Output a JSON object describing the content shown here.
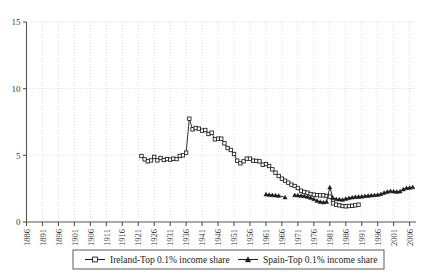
{
  "chart_data": {
    "type": "line",
    "title": "",
    "subtitle": "",
    "xlabel": "",
    "ylabel": "",
    "xlim": [
      1886,
      2008
    ],
    "ylim": [
      0,
      15
    ],
    "yticks": [
      0,
      5,
      10,
      15
    ],
    "xticks": [
      1886,
      1891,
      1896,
      1901,
      1906,
      1911,
      1916,
      1921,
      1926,
      1931,
      1936,
      1941,
      1946,
      1951,
      1956,
      1961,
      1966,
      1971,
      1976,
      1981,
      1986,
      1991,
      1996,
      2001,
      2006
    ],
    "grid": true,
    "grid_style": "dotted",
    "grid_color": "#c8c8c8",
    "legend_position": "bottom-outside",
    "axis_color": "#555555",
    "series": [
      {
        "name": "Ireland-Top 0.1% income share",
        "legend_label": "Ireland-Top 0.1% income share",
        "marker": "open-square",
        "color": "#1a1a1a",
        "x": [
          1922,
          1923,
          1924,
          1925,
          1926,
          1927,
          1928,
          1929,
          1930,
          1931,
          1932,
          1933,
          1934,
          1935,
          1936,
          1937,
          1938,
          1939,
          1940,
          1941,
          1942,
          1943,
          1944,
          1945,
          1946,
          1947,
          1948,
          1949,
          1950,
          1951,
          1952,
          1953,
          1954,
          1955,
          1956,
          1957,
          1958,
          1959,
          1960,
          1961,
          1962,
          1963,
          1964,
          1965,
          1966,
          1967,
          1968,
          1969,
          1970,
          1971,
          1972,
          1973,
          1974,
          1975,
          1976,
          1977,
          1978,
          1979,
          1980,
          1981,
          1982,
          1983,
          1984,
          1985,
          1986,
          1987,
          1988,
          1989,
          1990
        ],
        "y": [
          4.95,
          4.7,
          4.55,
          4.62,
          4.88,
          4.62,
          4.8,
          4.65,
          4.72,
          4.68,
          4.75,
          4.72,
          4.95,
          5.0,
          5.2,
          7.75,
          6.95,
          7.05,
          7.0,
          6.85,
          6.9,
          6.6,
          6.7,
          6.2,
          6.25,
          6.25,
          5.9,
          5.55,
          5.4,
          5.1,
          4.6,
          4.4,
          4.55,
          4.75,
          4.75,
          4.6,
          4.58,
          4.55,
          4.3,
          4.35,
          4.2,
          3.95,
          3.7,
          3.45,
          3.25,
          3.1,
          2.95,
          2.8,
          2.7,
          2.55,
          2.35,
          2.25,
          2.2,
          2.1,
          2.05,
          2.02,
          2.0,
          2.0,
          1.95,
          1.9,
          1.4,
          1.3,
          1.25,
          1.2,
          1.18,
          1.2,
          1.22,
          1.25,
          1.3
        ]
      },
      {
        "name": "Spain-Top 0.1% income share",
        "legend_label": "Spain-Top 0.1% income share",
        "marker": "filled-triangle",
        "color": "#1a1a1a",
        "x": [
          1961,
          1962,
          1963,
          1964,
          1965,
          1967,
          1970,
          1971,
          1972,
          1973,
          1974,
          1975,
          1976,
          1977,
          1978,
          1979,
          1980,
          1981,
          1982,
          1983,
          1984,
          1985,
          1986,
          1987,
          1988,
          1989,
          1990,
          1991,
          1992,
          1993,
          1994,
          1995,
          1996,
          1997,
          1998,
          1999,
          2000,
          2001,
          2002,
          2003,
          2004,
          2005,
          2006,
          2007
        ],
        "y": [
          2.08,
          2.05,
          2.02,
          2.0,
          1.98,
          1.85,
          2.02,
          2.0,
          1.98,
          1.95,
          1.9,
          1.82,
          1.72,
          1.6,
          1.52,
          1.48,
          1.52,
          2.6,
          1.8,
          1.72,
          1.7,
          1.68,
          1.75,
          1.8,
          1.85,
          1.88,
          1.9,
          1.92,
          1.95,
          1.98,
          2.0,
          2.02,
          2.05,
          2.1,
          2.2,
          2.28,
          2.32,
          2.3,
          2.28,
          2.3,
          2.45,
          2.55,
          2.58,
          2.62
        ]
      }
    ]
  },
  "legend": {
    "entries": [
      {
        "label": "Ireland-Top 0.1% income share",
        "marker": "open-square"
      },
      {
        "label": "Spain-Top 0.1% income share",
        "marker": "filled-triangle"
      }
    ]
  },
  "axes": {
    "y_labels": [
      "0",
      "5",
      "10",
      "15"
    ],
    "x_labels": [
      "1886",
      "1891",
      "1896",
      "1901",
      "1906",
      "1911",
      "1916",
      "1921",
      "1926",
      "1931",
      "1936",
      "1941",
      "1946",
      "1951",
      "1956",
      "1961",
      "1966",
      "1971",
      "1976",
      "1981",
      "1986",
      "1991",
      "1996",
      "2001",
      "2006"
    ]
  }
}
